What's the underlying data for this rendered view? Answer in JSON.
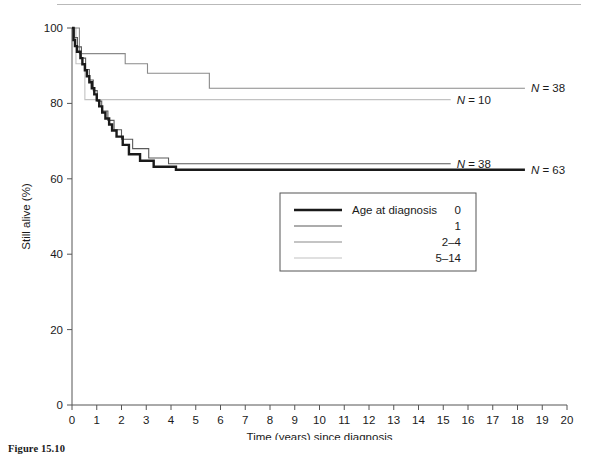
{
  "figure": {
    "caption": "Figure 15.10"
  },
  "chart_data": {
    "type": "line",
    "subtype": "kaplan-meier-step",
    "title": "",
    "xlabel": "Time (years) since diagnosis",
    "ylabel": "Still alive (%)",
    "xlim": [
      0,
      20
    ],
    "ylim": [
      0,
      100
    ],
    "xticks": [
      "0",
      "1",
      "2",
      "3",
      "4",
      "5",
      "6",
      "7",
      "8",
      "9",
      "10",
      "11",
      "12",
      "13",
      "14",
      "15",
      "16",
      "17",
      "18",
      "19",
      "20"
    ],
    "yticks": [
      "0",
      "20",
      "40",
      "60",
      "80",
      "100"
    ],
    "grid": false,
    "legend": {
      "title": "Age at diagnosis",
      "position": "inside-center",
      "entries": [
        {
          "label": "0",
          "color": "#1a1a1a",
          "width": 2.4,
          "n": 63
        },
        {
          "label": "1",
          "color": "#5a5a5a",
          "width": 1.1,
          "n": 38
        },
        {
          "label": "2–4",
          "color": "#8a8a8a",
          "width": 1.1,
          "n": 38
        },
        {
          "label": "5–14",
          "color": "#c2c2c2",
          "width": 1.1,
          "n": 10
        }
      ]
    },
    "annotations": [
      {
        "text": "N = 38",
        "series": "2–4",
        "x": 18.3,
        "y": 84.0
      },
      {
        "text": "N = 10",
        "series": "5–14",
        "x": 15.3,
        "y": 81.0
      },
      {
        "text": "N = 38",
        "series": "1",
        "x": 15.3,
        "y": 64.0
      },
      {
        "text": "N = 63",
        "series": "0",
        "x": 18.3,
        "y": 62.3
      }
    ],
    "series": [
      {
        "name": "0",
        "n": 63,
        "color": "#1a1a1a",
        "width": 2.4,
        "points": [
          [
            0.0,
            100.0
          ],
          [
            0.06,
            100.0
          ],
          [
            0.06,
            96.8
          ],
          [
            0.12,
            96.8
          ],
          [
            0.12,
            95.2
          ],
          [
            0.2,
            95.2
          ],
          [
            0.2,
            93.7
          ],
          [
            0.34,
            93.7
          ],
          [
            0.34,
            92.0
          ],
          [
            0.42,
            92.0
          ],
          [
            0.42,
            90.4
          ],
          [
            0.52,
            90.4
          ],
          [
            0.52,
            88.8
          ],
          [
            0.6,
            88.8
          ],
          [
            0.6,
            87.2
          ],
          [
            0.7,
            87.2
          ],
          [
            0.7,
            85.6
          ],
          [
            0.8,
            85.6
          ],
          [
            0.8,
            84.0
          ],
          [
            0.9,
            84.0
          ],
          [
            0.9,
            82.4
          ],
          [
            1.0,
            82.4
          ],
          [
            1.0,
            80.8
          ],
          [
            1.1,
            80.8
          ],
          [
            1.1,
            79.2
          ],
          [
            1.22,
            79.2
          ],
          [
            1.22,
            77.6
          ],
          [
            1.35,
            77.6
          ],
          [
            1.35,
            76.0
          ],
          [
            1.5,
            76.0
          ],
          [
            1.5,
            74.4
          ],
          [
            1.62,
            74.4
          ],
          [
            1.62,
            72.8
          ],
          [
            1.8,
            72.8
          ],
          [
            1.8,
            71.2
          ],
          [
            2.05,
            71.2
          ],
          [
            2.05,
            69.0
          ],
          [
            2.3,
            69.0
          ],
          [
            2.3,
            66.5
          ],
          [
            2.75,
            66.5
          ],
          [
            2.75,
            64.8
          ],
          [
            3.3,
            64.8
          ],
          [
            3.3,
            63.2
          ],
          [
            4.2,
            63.2
          ],
          [
            4.2,
            62.4
          ],
          [
            18.3,
            62.4
          ]
        ]
      },
      {
        "name": "1",
        "n": 38,
        "color": "#5a5a5a",
        "width": 1.1,
        "points": [
          [
            0.0,
            100.0
          ],
          [
            0.1,
            100.0
          ],
          [
            0.1,
            97.5
          ],
          [
            0.22,
            97.5
          ],
          [
            0.22,
            95.0
          ],
          [
            0.38,
            95.0
          ],
          [
            0.38,
            92.0
          ],
          [
            0.55,
            92.0
          ],
          [
            0.55,
            89.0
          ],
          [
            0.7,
            89.0
          ],
          [
            0.7,
            86.2
          ],
          [
            0.86,
            86.2
          ],
          [
            0.86,
            83.4
          ],
          [
            1.02,
            83.4
          ],
          [
            1.02,
            80.6
          ],
          [
            1.2,
            80.6
          ],
          [
            1.2,
            78.0
          ],
          [
            1.45,
            78.0
          ],
          [
            1.45,
            75.5
          ],
          [
            1.7,
            75.5
          ],
          [
            1.7,
            73.0
          ],
          [
            2.0,
            73.0
          ],
          [
            2.0,
            70.5
          ],
          [
            2.45,
            70.5
          ],
          [
            2.45,
            68.0
          ],
          [
            3.1,
            68.0
          ],
          [
            3.1,
            65.5
          ],
          [
            3.9,
            65.5
          ],
          [
            3.9,
            64.0
          ],
          [
            15.3,
            64.0
          ]
        ]
      },
      {
        "name": "2–4",
        "n": 38,
        "color": "#8a8a8a",
        "width": 1.1,
        "points": [
          [
            0.0,
            100.0
          ],
          [
            0.3,
            100.0
          ],
          [
            0.3,
            93.2
          ],
          [
            2.15,
            93.2
          ],
          [
            2.15,
            90.5
          ],
          [
            3.05,
            90.5
          ],
          [
            3.05,
            88.0
          ],
          [
            5.55,
            88.0
          ],
          [
            5.55,
            84.0
          ],
          [
            18.3,
            84.0
          ]
        ]
      },
      {
        "name": "5–14",
        "n": 10,
        "color": "#c2c2c2",
        "width": 1.1,
        "points": [
          [
            0.0,
            100.0
          ],
          [
            0.16,
            100.0
          ],
          [
            0.16,
            90.5
          ],
          [
            0.52,
            90.5
          ],
          [
            0.52,
            81.0
          ],
          [
            15.3,
            81.0
          ]
        ]
      }
    ]
  },
  "legend_box": {
    "title": "Age at diagnosis"
  }
}
